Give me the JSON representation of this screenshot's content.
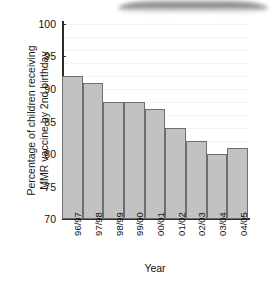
{
  "chart_data": {
    "type": "bar",
    "title": "",
    "xlabel": "Year",
    "ylabel": "Percentage of children receiving\nMMR vaccine by 2nd birthday",
    "categories": [
      "96/97",
      "97/98",
      "98/99",
      "99/00",
      "00/01",
      "01/02",
      "02/03",
      "03/04",
      "04/05"
    ],
    "values": [
      92,
      91,
      88,
      88,
      87,
      84,
      82,
      80,
      81
    ],
    "ylim": [
      70,
      100
    ],
    "yticks": [
      100,
      95,
      90,
      85,
      80,
      75,
      70
    ],
    "ytick_labels": [
      "100",
      "95",
      "90",
      "85",
      "80",
      "75",
      "70"
    ],
    "grid": true,
    "legend": "none",
    "bar_fill": "#c2c2c2",
    "bar_border": "#6e6e6e",
    "axis_color": "#2b2b2b"
  },
  "artifact": {
    "name": "scan-smudge"
  }
}
